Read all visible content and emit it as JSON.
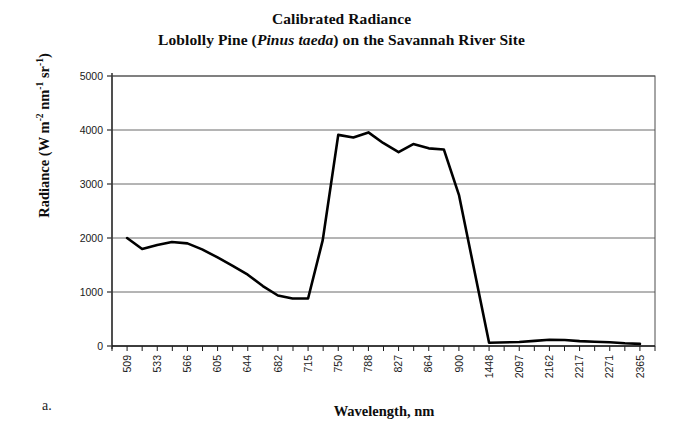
{
  "figure": {
    "caption_label": "a.",
    "title_line1": "Calibrated Radiance",
    "title_line2_pre": "Loblolly Pine (",
    "title_line2_species": "Pinus taeda",
    "title_line2_post": ") on the Savannah River Site",
    "title_line2_full": "Loblolly Pine (Pinus taeda) on the Savannah River Site"
  },
  "axes": {
    "y_title_text": "Radiance (W m-2 nm-1 sr-1)",
    "y_title_prefix": "Radiance (W m",
    "y_title_sup1": "-2",
    "y_title_mid1": " nm",
    "y_title_sup2": "-1",
    "y_title_mid2": " sr",
    "y_title_sup3": "-1",
    "y_title_suffix": ")",
    "x_title": "Wavelength, nm"
  },
  "chart_data": {
    "type": "line",
    "title": "Calibrated Radiance\nLoblolly Pine (Pinus taeda) on the Savannah River Site",
    "xlabel": "Wavelength, nm",
    "ylabel": "Radiance (W m-2 nm-1 sr-1)",
    "ylim": [
      0,
      5000
    ],
    "yticks": [
      0,
      1000,
      2000,
      3000,
      4000,
      5000
    ],
    "ytick_labels": [
      "0",
      "1000",
      "2000",
      "3000",
      "4000",
      "5000"
    ],
    "grid": "horizontal",
    "legend": "none",
    "line_color": "#000000",
    "line_width": 2.6,
    "x_categories": [
      "509",
      "533",
      "566",
      "605",
      "644",
      "682",
      "715",
      "750",
      "788",
      "827",
      "864",
      "900",
      "1448",
      "2097",
      "2162",
      "2217",
      "2271",
      "2365"
    ],
    "x_is_categorical": true,
    "minor_ticks_between_labels": 1,
    "series": [
      {
        "name": "Calibrated radiance",
        "x": [
          "509",
          "521",
          "533",
          "549",
          "566",
          "585",
          "605",
          "624",
          "644",
          "663",
          "682",
          "698",
          "715",
          "732",
          "750",
          "769",
          "788",
          "807",
          "827",
          "845",
          "864",
          "882",
          "900",
          "1448",
          "2097",
          "2130",
          "2162",
          "2190",
          "2217",
          "2244",
          "2271",
          "2318",
          "2365"
        ],
        "values": [
          2000,
          1795,
          1870,
          1925,
          1900,
          1790,
          1640,
          1490,
          1320,
          1110,
          935,
          880,
          880,
          1960,
          3910,
          3860,
          3955,
          3760,
          3590,
          3740,
          3660,
          3640,
          2800,
          60,
          75,
          95,
          115,
          110,
          90,
          80,
          70,
          50,
          40
        ]
      }
    ],
    "annotations": [
      {
        "text": "a.",
        "position": "below-left-of-axes"
      }
    ]
  },
  "plot_geometry": {
    "left": 112,
    "right": 655,
    "top": 76,
    "bottom": 346,
    "y_min": 0,
    "y_max": 5000
  }
}
